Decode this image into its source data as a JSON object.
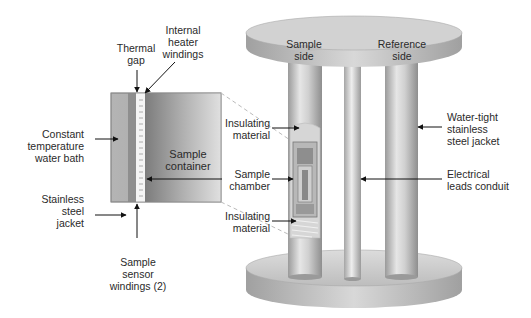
{
  "figure": {
    "detail_view": {
      "labels": {
        "thermal_gap": [
          "Thermal",
          "gap"
        ],
        "internal_heater": [
          "Internal",
          "heater",
          "windings"
        ],
        "water_bath": [
          "Constant",
          "temperature",
          "water bath"
        ],
        "sample_container": [
          "Sample",
          "container"
        ],
        "steel_jacket": [
          "Stainless",
          "steel",
          "jacket"
        ],
        "sensor_windings": [
          "Sample",
          "sensor",
          "windings (2)"
        ]
      }
    },
    "apparatus": {
      "labels": {
        "sample_side": [
          "Sample",
          "side"
        ],
        "reference_side": [
          "Reference",
          "side"
        ],
        "insulating_top": [
          "Insulating",
          "material"
        ],
        "sample_chamber": [
          "Sample",
          "chamber"
        ],
        "insulating_bottom": [
          "Insulating",
          "material"
        ],
        "water_tight_jacket": [
          "Water-tight",
          "stainless",
          "steel jacket"
        ],
        "electrical_conduit": [
          "Electrical",
          "leads conduit"
        ]
      }
    }
  }
}
